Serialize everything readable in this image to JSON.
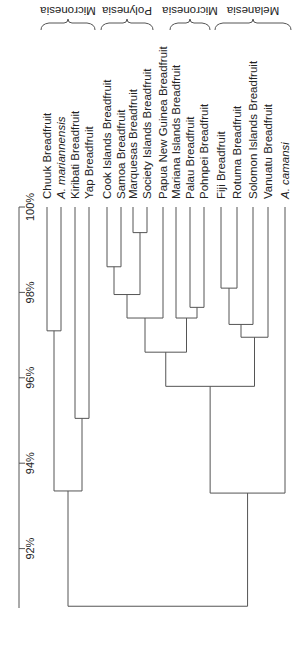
{
  "chart_data": {
    "type": "dendrogram",
    "orientation": "rotated-90-clockwise",
    "title": "",
    "axis": {
      "label": "",
      "ticks": [
        "100%",
        "98%",
        "96%",
        "94%",
        "92%"
      ],
      "tick_values": [
        100,
        98,
        96,
        94,
        92
      ],
      "range": [
        90.6,
        100
      ]
    },
    "leaves": [
      {
        "label": "Chuuk Breadfruit",
        "italic": false
      },
      {
        "label": "A. mariannensis",
        "italic": true
      },
      {
        "label": "Kiribati Breadfruit",
        "italic": false
      },
      {
        "label": "Yap Breadfruit",
        "italic": false
      },
      {
        "label": "Cook Islands Breadfruit",
        "italic": false
      },
      {
        "label": "Samoa  Breadfruit",
        "italic": false
      },
      {
        "label": "Marquesas  Breadfruit",
        "italic": false
      },
      {
        "label": "Society Islands  Breadfruit",
        "italic": false
      },
      {
        "label": "Papua New Guinea  Breadfruit",
        "italic": false
      },
      {
        "label": "Mariana Islands  Breadfruit",
        "italic": false
      },
      {
        "label": "Palau  Breadfruit",
        "italic": false
      },
      {
        "label": "Pohnpei  Breadfruit",
        "italic": false
      },
      {
        "label": "Fiji Breadfruit",
        "italic": false
      },
      {
        "label": "Rotuma  Breadfruit",
        "italic": false
      },
      {
        "label": "Solomon  Islands  Breadfruit",
        "italic": false
      },
      {
        "label": "Vanuatu  Breadfruit",
        "italic": false
      },
      {
        "label": "A. camansi",
        "italic": true
      }
    ],
    "merges": [
      {
        "id": "m1",
        "children": [
          "L6",
          "L7"
        ],
        "similarity": 99.4
      },
      {
        "id": "m2",
        "children": [
          "L4",
          "L5"
        ],
        "similarity": 98.6
      },
      {
        "id": "m3",
        "children": [
          "m2",
          "m1"
        ],
        "similarity": 97.95
      },
      {
        "id": "m4",
        "children": [
          "m3",
          "L8"
        ],
        "similarity": 97.4
      },
      {
        "id": "m5",
        "children": [
          "L10",
          "L11"
        ],
        "similarity": 97.65
      },
      {
        "id": "m6",
        "children": [
          "L9",
          "m5"
        ],
        "similarity": 97.4
      },
      {
        "id": "m7",
        "children": [
          "m4",
          "m6"
        ],
        "similarity": 96.6
      },
      {
        "id": "m8",
        "children": [
          "L12",
          "L13"
        ],
        "similarity": 98.1
      },
      {
        "id": "m9",
        "children": [
          "m8",
          "L14"
        ],
        "similarity": 97.25
      },
      {
        "id": "m10",
        "children": [
          "m9",
          "L15"
        ],
        "similarity": 96.95
      },
      {
        "id": "m11",
        "children": [
          "m7",
          "m10"
        ],
        "similarity": 95.8
      },
      {
        "id": "m12",
        "children": [
          "m11",
          "L16"
        ],
        "similarity": 93.3
      },
      {
        "id": "m13",
        "children": [
          "L0",
          "L1"
        ],
        "similarity": 97.1
      },
      {
        "id": "m14",
        "children": [
          "L2",
          "L3"
        ],
        "similarity": 95.05
      },
      {
        "id": "m15",
        "children": [
          "m13",
          "m14"
        ],
        "similarity": 93.35
      },
      {
        "id": "m16",
        "children": [
          "m15",
          "m12"
        ],
        "similarity": 90.65
      }
    ],
    "groups": [
      {
        "label": "Micronesia",
        "from_leaf": 0,
        "to_leaf": 3
      },
      {
        "label": "Polynesia",
        "from_leaf": 4,
        "to_leaf": 7
      },
      {
        "label": "Micronesia",
        "from_leaf": 9,
        "to_leaf": 11
      },
      {
        "label": "Melanesia",
        "from_leaf": 12,
        "to_leaf": 16
      }
    ]
  },
  "layout": {
    "leaf_x": [
      47,
      61,
      75,
      89,
      107,
      121,
      133,
      147,
      163,
      176,
      190,
      204,
      221,
      237,
      253,
      268,
      285
    ],
    "axis_x": 19,
    "y_at_100": 207,
    "px_per_percent": 42.7,
    "axis_bottom": 608,
    "line_color": "#555555",
    "text_color": "#222222"
  }
}
